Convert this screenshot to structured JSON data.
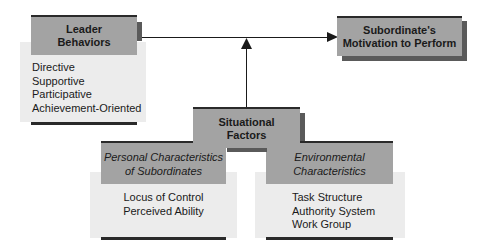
{
  "diagram": {
    "leader": {
      "title_line1": "Leader",
      "title_line2": "Behaviors",
      "items": [
        "Directive",
        "Supportive",
        "Participative",
        "Achievement-Oriented"
      ]
    },
    "outcome": {
      "title_line1": "Subordinate's",
      "title_line2": "Motivation to Perform"
    },
    "situational": {
      "title_line1": "Situational",
      "title_line2": "Factors"
    },
    "personal": {
      "title_line1": "Personal Characteristics",
      "title_line2": "of Subordinates",
      "items": [
        "Locus of Control",
        "Perceived Ability"
      ]
    },
    "environmental": {
      "title_line1": "Environmental",
      "title_line2": "Characteristics",
      "items": [
        "Task Structure",
        "Authority System",
        "Work Group"
      ]
    },
    "colors": {
      "header_fill": "#a3a3a3",
      "body_fill": "#ececec",
      "rule": "#2a2a2a",
      "shadow": "#5a5a5a"
    }
  }
}
